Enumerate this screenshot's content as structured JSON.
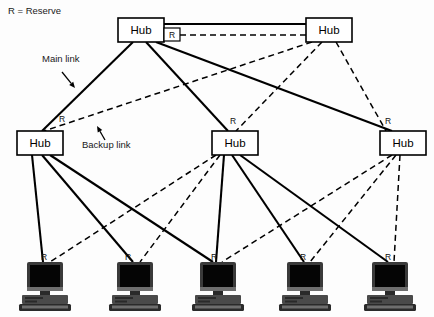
{
  "legend": {
    "reserve_note": "R = Reserve"
  },
  "annotations": [
    {
      "name": "main-link-annotation",
      "label": "Main link",
      "x": 42,
      "y": 62
    },
    {
      "name": "backup-link-annotation",
      "label": "Backup link",
      "x": 82,
      "y": 148
    }
  ],
  "hubs": [
    {
      "id": "hub-top-left",
      "label": "Hub",
      "x": 118,
      "y": 18,
      "w": 46,
      "h": 24
    },
    {
      "id": "hub-top-right",
      "label": "Hub",
      "x": 306,
      "y": 18,
      "w": 46,
      "h": 24
    },
    {
      "id": "hub-mid-left",
      "label": "Hub",
      "x": 17,
      "y": 131,
      "w": 46,
      "h": 24
    },
    {
      "id": "hub-mid-center",
      "label": "Hub",
      "x": 212,
      "y": 131,
      "w": 46,
      "h": 24
    },
    {
      "id": "hub-mid-right",
      "label": "Hub",
      "x": 380,
      "y": 131,
      "w": 46,
      "h": 24
    }
  ],
  "hub_r_badge": {
    "label": "R",
    "x": 164,
    "y": 28,
    "w": 16,
    "h": 13
  },
  "computers": [
    {
      "id": "computer-1",
      "x": 45,
      "y": 266,
      "r_label": "R"
    },
    {
      "id": "computer-2",
      "x": 135,
      "y": 266,
      "r_label": "R"
    },
    {
      "id": "computer-3",
      "x": 218,
      "y": 266,
      "r_label": "R"
    },
    {
      "id": "computer-4",
      "x": 305,
      "y": 266,
      "r_label": "R"
    },
    {
      "id": "computer-5",
      "x": 390,
      "y": 266,
      "r_label": "R"
    }
  ],
  "r_markers": [
    {
      "name": "r-marker-hub-mid-left",
      "label": "R",
      "x": 62,
      "y": 122
    },
    {
      "name": "r-marker-hub-mid-center",
      "label": "R",
      "x": 233,
      "y": 124
    },
    {
      "name": "r-marker-hub-mid-right",
      "label": "R",
      "x": 388,
      "y": 124
    },
    {
      "name": "r-marker-computer-1",
      "label": "R",
      "x": 44,
      "y": 260
    },
    {
      "name": "r-marker-computer-2",
      "label": "R",
      "x": 128,
      "y": 260
    },
    {
      "name": "r-marker-computer-3",
      "label": "R",
      "x": 214,
      "y": 260
    },
    {
      "name": "r-marker-computer-4",
      "label": "R",
      "x": 303,
      "y": 260
    },
    {
      "name": "r-marker-computer-5",
      "label": "R",
      "x": 388,
      "y": 260
    }
  ],
  "main_links": [
    {
      "name": "link-main-topleft-topright",
      "x1": 164,
      "y1": 24,
      "x2": 306,
      "y2": 24
    },
    {
      "name": "link-main-topleft-midleft",
      "x1": 133,
      "y1": 42,
      "x2": 42,
      "y2": 131
    },
    {
      "name": "link-main-topleft-midcenter",
      "x1": 146,
      "y1": 42,
      "x2": 228,
      "y2": 131
    },
    {
      "name": "link-main-topleft-midright",
      "x1": 156,
      "y1": 42,
      "x2": 392,
      "y2": 131
    },
    {
      "name": "link-main-midleft-comp1",
      "x1": 32,
      "y1": 155,
      "x2": 43,
      "y2": 262
    },
    {
      "name": "link-main-midleft-comp2",
      "x1": 42,
      "y1": 155,
      "x2": 133,
      "y2": 262
    },
    {
      "name": "link-main-midleft-comp3",
      "x1": 50,
      "y1": 155,
      "x2": 213,
      "y2": 262
    },
    {
      "name": "link-main-midcenter-comp3",
      "x1": 224,
      "y1": 155,
      "x2": 216,
      "y2": 262
    },
    {
      "name": "link-main-midcenter-comp4",
      "x1": 232,
      "y1": 155,
      "x2": 304,
      "y2": 262
    },
    {
      "name": "link-main-midcenter-comp5",
      "x1": 240,
      "y1": 155,
      "x2": 388,
      "y2": 262
    }
  ],
  "backup_links": [
    {
      "name": "link-backup-topleft-topright",
      "x1": 180,
      "y1": 35,
      "x2": 306,
      "y2": 35
    },
    {
      "name": "link-backup-topright-midleft",
      "x1": 312,
      "y1": 42,
      "x2": 44,
      "y2": 131
    },
    {
      "name": "link-backup-topright-midcenter",
      "x1": 322,
      "y1": 42,
      "x2": 236,
      "y2": 131
    },
    {
      "name": "link-backup-topright-midright",
      "x1": 336,
      "y1": 42,
      "x2": 386,
      "y2": 131
    },
    {
      "name": "link-backup-midcenter-comp1",
      "x1": 216,
      "y1": 155,
      "x2": 50,
      "y2": 262
    },
    {
      "name": "link-backup-midcenter-comp2",
      "x1": 220,
      "y1": 155,
      "x2": 140,
      "y2": 262
    },
    {
      "name": "link-backup-midright-comp3",
      "x1": 392,
      "y1": 155,
      "x2": 222,
      "y2": 262
    },
    {
      "name": "link-backup-midright-comp4",
      "x1": 396,
      "y1": 155,
      "x2": 310,
      "y2": 262
    },
    {
      "name": "link-backup-midright-comp5",
      "x1": 400,
      "y1": 155,
      "x2": 394,
      "y2": 262
    }
  ],
  "arrows": [
    {
      "name": "main-link-arrow",
      "x1": 62,
      "y1": 72,
      "x2": 75,
      "y2": 88
    },
    {
      "name": "backup-link-arrow",
      "x1": 105,
      "y1": 140,
      "x2": 97,
      "y2": 126
    }
  ]
}
